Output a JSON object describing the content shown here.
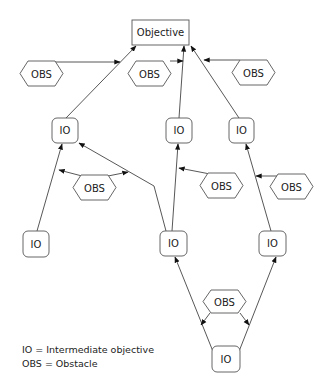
{
  "diagram": {
    "objective": {
      "label": "Objective"
    },
    "io_label": "IO",
    "obs_label": "OBS",
    "nodes": {
      "io_top_left": "IO",
      "io_top_mid": "IO",
      "io_top_right": "IO",
      "io_mid_left": "IO",
      "io_mid_center": "IO",
      "io_mid_right": "IO",
      "io_bottom": "IO",
      "obs_top_left": "OBS",
      "obs_top_mid": "OBS",
      "obs_top_right": "OBS",
      "obs_mid_left": "OBS",
      "obs_mid_center": "OBS",
      "obs_mid_right": "OBS",
      "obs_bottom": "OBS"
    },
    "colors": {
      "stroke": "#555555",
      "text": "#222222",
      "background": "#ffffff"
    }
  },
  "legend": {
    "io": "IO = Intermediate objective",
    "obs": "OBS = Obstacle"
  }
}
